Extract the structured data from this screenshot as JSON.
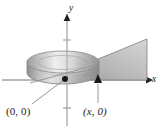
{
  "figure": {
    "background_color": "#ffffff"
  },
  "axes": {
    "x_axis": {
      "label": "x",
      "arrow": "right-arrowhead",
      "color": "#6e6e6e",
      "y_position_px": 80,
      "x_start_px": 2,
      "x_end_px": 148
    },
    "y_axis": {
      "label": "y",
      "arrow": "up-arrowhead",
      "color": "#6e6e6e",
      "x_position_px": 67,
      "y_start_px": 14,
      "y_end_px": 126
    },
    "origin_px": {
      "x": 67,
      "y": 80
    }
  },
  "labels": {
    "origin": {
      "open_paren": "(",
      "first": "0",
      "comma": ", ",
      "second": "0",
      "close_paren": ")",
      "full_text": "(0, 0)"
    },
    "x_point": {
      "open_paren": "(",
      "first": "x",
      "comma": ", ",
      "second": "0",
      "close_paren": ")",
      "full_text": "(x, 0)"
    }
  },
  "leader_lines": [
    {
      "name": "origin-leader",
      "from_px": {
        "x": 32,
        "y": 104
      },
      "to_px": {
        "x": 65,
        "y": 79
      },
      "color": "#8a8a8a"
    },
    {
      "name": "xpoint-leader",
      "from_px": {
        "x": 98,
        "y": 103
      },
      "to_px": {
        "x": 98,
        "y": 83
      },
      "color": "#9a9a9a"
    }
  ],
  "markers": [
    {
      "name": "origin-point",
      "shape": "filled-dot",
      "px": {
        "x": 65,
        "y": 79
      },
      "color": "#1c1c1c"
    },
    {
      "name": "x-point",
      "shape": "filled-triangle",
      "px": {
        "x": 98,
        "y": 80
      },
      "color": "#1c1c1c"
    }
  ],
  "shapes": {
    "cylinder": {
      "name": "disk-solid",
      "center_px": {
        "x": 63,
        "y": 62
      },
      "radius_x_px": 36,
      "radius_y_px": 11,
      "height_px": 22,
      "fill_light": "#f1f1f1",
      "fill_mid": "#c9c9c9",
      "fill_dark": "#8f8f8f",
      "outline": "#8a8a8a"
    },
    "plane": {
      "name": "cutting-plane-wedge",
      "points_px": "63,72 147,39 147,80 72,80",
      "fill_light": "#d8d8d8",
      "fill_dark": "#9d9d9d",
      "outline": "#6a6a6a"
    }
  },
  "colors": {
    "ink": "#1a1a1a",
    "axis": "#6e6e6e",
    "solid_light": "#f1f1f1",
    "solid_mid": "#c9c9c9",
    "solid_dark": "#8f8f8f",
    "plane": "#b4b4b4"
  }
}
